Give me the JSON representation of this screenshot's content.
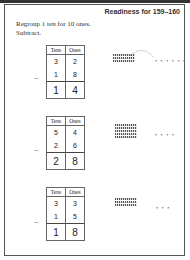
{
  "header": {
    "title": "Readiness for 159–160"
  },
  "instructions": {
    "line1": "Regroup 1 ten for 10 ones.",
    "line2": "Subtract."
  },
  "col_headers": {
    "tens": "Tens",
    "ones": "Ones"
  },
  "problems": [
    {
      "top_tens": "3",
      "top_ones": "2",
      "sub_tens": "1",
      "sub_ones": "8",
      "ans_tens": "1",
      "ans_ones": "4",
      "minus": "−",
      "dots": "• • • • • •"
    },
    {
      "top_tens": "5",
      "top_ones": "4",
      "sub_tens": "2",
      "sub_ones": "6",
      "ans_tens": "2",
      "ans_ones": "8",
      "minus": "−",
      "dots": "• • • •"
    },
    {
      "top_tens": "3",
      "top_ones": "3",
      "sub_tens": "1",
      "sub_ones": "5",
      "ans_tens": "1",
      "ans_ones": "8",
      "minus": "−",
      "dots": "• • •"
    }
  ]
}
